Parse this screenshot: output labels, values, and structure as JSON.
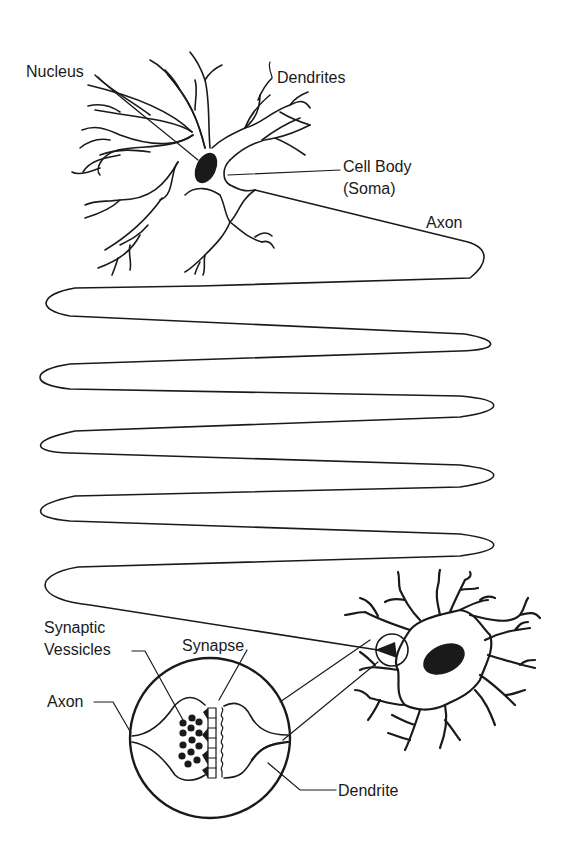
{
  "diagram": {
    "colors": {
      "ink": "#1a1a1a",
      "background": "#ffffff"
    },
    "labels": {
      "nucleus": "Nucleus",
      "dendrites": "Dendrites",
      "cell_body_line1": "Cell Body",
      "cell_body_line2": "(Soma)",
      "axon_top": "Axon",
      "synaptic_vesicles_line1": "Synaptic",
      "synaptic_vesicles_line2": "Vessicles",
      "synapse": "Synapse",
      "axon_inset": "Axon",
      "dendrite": "Dendrite"
    }
  }
}
